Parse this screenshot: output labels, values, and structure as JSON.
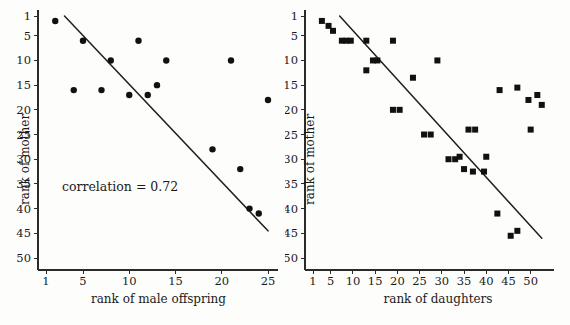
{
  "figure": {
    "background_color": "#fdfdfc",
    "marker_color": "#111111",
    "line_color": "#1f1f1f",
    "axis_color": "#2b2b2b"
  },
  "chart_data": [
    {
      "type": "scatter",
      "panel": "left",
      "title": "",
      "xlabel": "rank of male offspring",
      "ylabel": "rank of mother",
      "annotation": "correlation = 0.72",
      "correlation": 0.72,
      "marker": "circle",
      "grid": false,
      "legend": "none",
      "xlim": [
        1,
        25
      ],
      "ylim": [
        1,
        50
      ],
      "y_inverted": true,
      "xticks": [
        1,
        5,
        10,
        15,
        20,
        25
      ],
      "xtick_labels": [
        "1",
        "5",
        "10",
        "15",
        "20",
        "25"
      ],
      "yticks": [
        1,
        5,
        10,
        15,
        20,
        25,
        30,
        35,
        40,
        45,
        50
      ],
      "ytick_labels": [
        "1",
        "5",
        "10",
        "15",
        "20",
        "25",
        "30",
        "35",
        "40",
        "45",
        "50"
      ],
      "x": [
        2,
        4,
        5,
        7,
        8,
        10,
        11,
        12,
        13,
        13,
        14,
        19,
        21,
        22,
        23,
        24,
        25
      ],
      "y": [
        2,
        16,
        6,
        16,
        10,
        17,
        6,
        17,
        15,
        15,
        10,
        28,
        10,
        32,
        40,
        41,
        18
      ],
      "points": [
        {
          "x": 2,
          "y": 2
        },
        {
          "x": 4,
          "y": 16
        },
        {
          "x": 5,
          "y": 6
        },
        {
          "x": 7,
          "y": 16
        },
        {
          "x": 8,
          "y": 10
        },
        {
          "x": 10,
          "y": 17
        },
        {
          "x": 11,
          "y": 6
        },
        {
          "x": 12,
          "y": 17
        },
        {
          "x": 13,
          "y": 15
        },
        {
          "x": 14,
          "y": 10
        },
        {
          "x": 19,
          "y": 28
        },
        {
          "x": 21,
          "y": 10
        },
        {
          "x": 22,
          "y": 32
        },
        {
          "x": 23,
          "y": 40
        },
        {
          "x": 24,
          "y": 41
        },
        {
          "x": 25,
          "y": 18
        }
      ],
      "trend_line": {
        "x1": 3.0,
        "y1": 1.0,
        "x2": 25.0,
        "y2": 44.5
      }
    },
    {
      "type": "scatter",
      "panel": "right",
      "title": "",
      "xlabel": "rank of daughters",
      "ylabel": "rank of mother",
      "annotation": "correlation = 0.74",
      "correlation": 0.74,
      "marker": "square",
      "grid": false,
      "legend": "none",
      "xlim": [
        1,
        53
      ],
      "ylim": [
        1,
        50
      ],
      "y_inverted": true,
      "xticks": [
        1,
        5,
        10,
        15,
        20,
        25,
        30,
        35,
        40,
        45,
        50
      ],
      "xtick_labels": [
        "1",
        "5",
        "10",
        "15",
        "20",
        "25",
        "30",
        "35",
        "40",
        "45",
        "50"
      ],
      "yticks": [
        1,
        5,
        10,
        15,
        20,
        25,
        30,
        35,
        40,
        45,
        50
      ],
      "ytick_labels": [
        "1",
        "5",
        "10",
        "15",
        "20",
        "25",
        "30",
        "35",
        "40",
        "45",
        "50"
      ],
      "points": [
        {
          "x": 3,
          "y": 2
        },
        {
          "x": 4.5,
          "y": 3
        },
        {
          "x": 5.5,
          "y": 4
        },
        {
          "x": 7.5,
          "y": 6
        },
        {
          "x": 8.5,
          "y": 6
        },
        {
          "x": 9.5,
          "y": 6
        },
        {
          "x": 13,
          "y": 6
        },
        {
          "x": 13,
          "y": 12
        },
        {
          "x": 14.5,
          "y": 10
        },
        {
          "x": 15.5,
          "y": 10
        },
        {
          "x": 19,
          "y": 6
        },
        {
          "x": 19,
          "y": 20
        },
        {
          "x": 20.5,
          "y": 20
        },
        {
          "x": 23.5,
          "y": 13.5
        },
        {
          "x": 26,
          "y": 25
        },
        {
          "x": 27.5,
          "y": 25
        },
        {
          "x": 29,
          "y": 10
        },
        {
          "x": 31.5,
          "y": 30
        },
        {
          "x": 33,
          "y": 30
        },
        {
          "x": 34,
          "y": 29.5
        },
        {
          "x": 35,
          "y": 32
        },
        {
          "x": 36,
          "y": 24
        },
        {
          "x": 37.5,
          "y": 24
        },
        {
          "x": 37,
          "y": 32.5
        },
        {
          "x": 39.5,
          "y": 32.5
        },
        {
          "x": 40,
          "y": 29.5
        },
        {
          "x": 42.5,
          "y": 41
        },
        {
          "x": 43,
          "y": 16
        },
        {
          "x": 45.5,
          "y": 45.5
        },
        {
          "x": 47,
          "y": 44.5
        },
        {
          "x": 47,
          "y": 15.5
        },
        {
          "x": 49.5,
          "y": 18
        },
        {
          "x": 50,
          "y": 24
        },
        {
          "x": 51.5,
          "y": 17
        },
        {
          "x": 52.5,
          "y": 19
        }
      ],
      "trend_line": {
        "x1": 7.0,
        "y1": 1.0,
        "x2": 52.5,
        "y2": 46.0
      }
    }
  ]
}
